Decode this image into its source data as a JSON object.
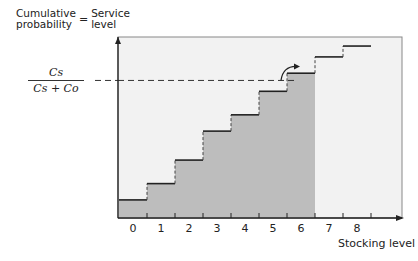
{
  "chart_data": {
    "type": "step",
    "title": "",
    "ylabel_parts": [
      "Cumulative probability",
      "=",
      "Service level"
    ],
    "ylabel_left": [
      "Cumulative",
      "probability"
    ],
    "ylabel_right": [
      "Service",
      "level"
    ],
    "equals": "=",
    "xlabel": "Stocking level",
    "threshold_label": {
      "numerator": "Cs",
      "denominator": "Cs + Co"
    },
    "categories": [
      "0",
      "1",
      "2",
      "3",
      "4",
      "5",
      "6",
      "7",
      "8"
    ],
    "values": [
      0.1,
      0.19,
      0.32,
      0.48,
      0.57,
      0.7,
      0.8,
      0.89,
      0.95
    ],
    "threshold": 0.76,
    "shaded_up_to": "6",
    "ylim": [
      0,
      1
    ],
    "grid": false,
    "legend": null
  },
  "colors": {
    "shade": "#bdbdbd",
    "background": "#f2f2f2",
    "line": "#222222"
  }
}
